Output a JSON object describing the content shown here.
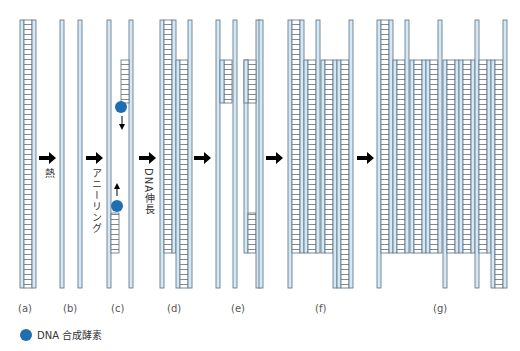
{
  "figure": {
    "steps": [
      {
        "id": "a",
        "label": "(a)"
      },
      {
        "id": "b",
        "label": "(b)"
      },
      {
        "id": "c",
        "label": "(c)"
      },
      {
        "id": "d",
        "label": "(d)"
      },
      {
        "id": "e",
        "label": "(e)"
      },
      {
        "id": "f",
        "label": "(f)"
      },
      {
        "id": "g",
        "label": "(g)"
      }
    ],
    "transitions": {
      "heat": "熱",
      "annealing": "アニーリング",
      "extension": "DNA伸長"
    },
    "legend": {
      "polymerase": "DNA 合成酵素"
    },
    "colors": {
      "strand_fill": "#d4e8f5",
      "strand_stroke": "#5a6f80",
      "polymerase": "#1f6fb0",
      "arrow": "#000000"
    }
  }
}
